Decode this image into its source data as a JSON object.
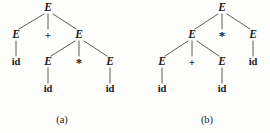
{
  "figure": {
    "kind": "parse-tree-pair",
    "ink_color": "#1b1b1b",
    "edge_color": "#4a4a4a",
    "background_color": "#fdfdfc"
  },
  "trees": [
    {
      "id": "a",
      "caption": "(a)",
      "caption_x": 62,
      "caption_y": 119,
      "nodes": [
        {
          "name": "a-root-E",
          "label": "E",
          "type": "nonterminal",
          "x": 48,
          "y": 8
        },
        {
          "name": "a-l1-E-left",
          "label": "E",
          "type": "nonterminal",
          "x": 16,
          "y": 35
        },
        {
          "name": "a-l1-plus",
          "label": "+",
          "type": "operator",
          "x": 48,
          "y": 35
        },
        {
          "name": "a-l1-E-right",
          "label": "E",
          "type": "nonterminal",
          "x": 79,
          "y": 35
        },
        {
          "name": "a-l2-id-left",
          "label": "id",
          "type": "terminal",
          "x": 16,
          "y": 62
        },
        {
          "name": "a-l2-E-left",
          "label": "E",
          "type": "nonterminal",
          "x": 48,
          "y": 62
        },
        {
          "name": "a-l2-star",
          "label": "*",
          "type": "operator",
          "x": 79,
          "y": 62
        },
        {
          "name": "a-l2-E-right",
          "label": "E",
          "type": "nonterminal",
          "x": 110,
          "y": 62
        },
        {
          "name": "a-l3-id-mid",
          "label": "id",
          "type": "terminal",
          "x": 48,
          "y": 89
        },
        {
          "name": "a-l3-id-right",
          "label": "id",
          "type": "terminal",
          "x": 110,
          "y": 89
        }
      ],
      "edges": [
        {
          "name": "a-edge-root-to-E-left",
          "x1": 44,
          "y1": 14,
          "x2": 19,
          "y2": 29
        },
        {
          "name": "a-edge-root-to-plus",
          "x1": 48,
          "y1": 14,
          "x2": 48,
          "y2": 29
        },
        {
          "name": "a-edge-root-to-E-right",
          "x1": 53,
          "y1": 14,
          "x2": 76,
          "y2": 29
        },
        {
          "name": "a-edge-Eleft-to-id",
          "x1": 16,
          "y1": 41,
          "x2": 16,
          "y2": 56
        },
        {
          "name": "a-edge-Eright-to-E",
          "x1": 75,
          "y1": 41,
          "x2": 51,
          "y2": 56
        },
        {
          "name": "a-edge-Eright-to-star",
          "x1": 79,
          "y1": 41,
          "x2": 79,
          "y2": 56
        },
        {
          "name": "a-edge-Eright-to-E2",
          "x1": 84,
          "y1": 41,
          "x2": 107,
          "y2": 56
        },
        {
          "name": "a-edge-Emid-to-id",
          "x1": 48,
          "y1": 68,
          "x2": 48,
          "y2": 83
        },
        {
          "name": "a-edge-Eright2-to-id",
          "x1": 110,
          "y1": 68,
          "x2": 110,
          "y2": 83
        }
      ]
    },
    {
      "id": "b",
      "caption": "(b)",
      "caption_x": 72,
      "caption_y": 119,
      "nodes": [
        {
          "name": "b-root-E",
          "label": "E",
          "type": "nonterminal",
          "x": 87,
          "y": 8
        },
        {
          "name": "b-l1-E-left",
          "label": "E",
          "type": "nonterminal",
          "x": 57,
          "y": 35
        },
        {
          "name": "b-l1-star",
          "label": "*",
          "type": "operator",
          "x": 87,
          "y": 35
        },
        {
          "name": "b-l1-E-right",
          "label": "E",
          "type": "nonterminal",
          "x": 118,
          "y": 35
        },
        {
          "name": "b-l2-E-left",
          "label": "E",
          "type": "nonterminal",
          "x": 27,
          "y": 62
        },
        {
          "name": "b-l2-plus",
          "label": "+",
          "type": "operator",
          "x": 57,
          "y": 62
        },
        {
          "name": "b-l2-E-right",
          "label": "E",
          "type": "nonterminal",
          "x": 87,
          "y": 62
        },
        {
          "name": "b-l2-id-right",
          "label": "id",
          "type": "terminal",
          "x": 118,
          "y": 62
        },
        {
          "name": "b-l3-id-left",
          "label": "id",
          "type": "terminal",
          "x": 27,
          "y": 89
        },
        {
          "name": "b-l3-id-mid",
          "label": "id",
          "type": "terminal",
          "x": 87,
          "y": 89
        }
      ],
      "edges": [
        {
          "name": "b-edge-root-to-E-left",
          "x1": 83,
          "y1": 14,
          "x2": 60,
          "y2": 29
        },
        {
          "name": "b-edge-root-to-star",
          "x1": 87,
          "y1": 14,
          "x2": 87,
          "y2": 29
        },
        {
          "name": "b-edge-root-to-E-right",
          "x1": 92,
          "y1": 14,
          "x2": 115,
          "y2": 29
        },
        {
          "name": "b-edge-Eleft-to-E",
          "x1": 53,
          "y1": 41,
          "x2": 30,
          "y2": 56
        },
        {
          "name": "b-edge-Eleft-to-plus",
          "x1": 57,
          "y1": 41,
          "x2": 57,
          "y2": 56
        },
        {
          "name": "b-edge-Eleft-to-E2",
          "x1": 62,
          "y1": 41,
          "x2": 84,
          "y2": 56
        },
        {
          "name": "b-edge-Eright-to-id",
          "x1": 118,
          "y1": 41,
          "x2": 118,
          "y2": 56
        },
        {
          "name": "b-edge-Emid-to-id",
          "x1": 27,
          "y1": 68,
          "x2": 27,
          "y2": 83
        },
        {
          "name": "b-edge-Emid2-to-id",
          "x1": 87,
          "y1": 68,
          "x2": 87,
          "y2": 83
        }
      ]
    }
  ]
}
